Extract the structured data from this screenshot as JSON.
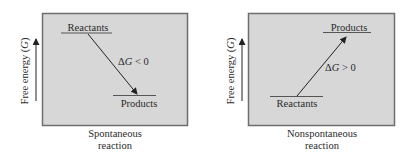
{
  "panels": [
    {
      "id": "spontaneous",
      "axis_label": "Free energy",
      "axis_symbol": "G",
      "reactants_label": "Reactants",
      "products_label": "Products",
      "delta_prefix": "Δ",
      "delta_symbol": "G",
      "delta_relation": " < 0",
      "caption_line1": "Spontaneous",
      "caption_line2": "reaction",
      "reactant_level": "high",
      "product_level": "low"
    },
    {
      "id": "nonspontaneous",
      "axis_label": "Free energy",
      "axis_symbol": "G",
      "reactants_label": "Reactants",
      "products_label": "Products",
      "delta_prefix": "Δ",
      "delta_symbol": "G",
      "delta_relation": " > 0",
      "caption_line1": "Nonspontaneous",
      "caption_line2": "reaction",
      "reactant_level": "low",
      "product_level": "high"
    }
  ],
  "colors": {
    "panel_fill": "#d7d7d7",
    "panel_border": "#6e6e6e",
    "line": "#333333"
  }
}
